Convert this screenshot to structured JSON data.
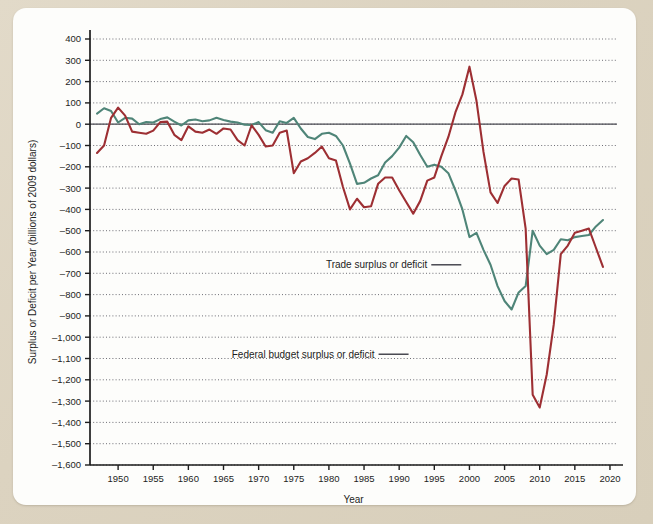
{
  "figure": {
    "background_color": "#ded5c2",
    "card_color": "#fdfdfb"
  },
  "chart_data": {
    "type": "line",
    "title": "",
    "xlabel": "Year",
    "ylabel": "Surplus or Deficit per Year (billions of 2009 dollars)",
    "xlim": [
      1946,
      2021
    ],
    "ylim": [
      -1600,
      400
    ],
    "grid": true,
    "legend_position": "inline-annotation",
    "x_ticks": [
      1950,
      1955,
      1960,
      1965,
      1970,
      1975,
      1980,
      1985,
      1990,
      1995,
      2000,
      2005,
      2010,
      2015,
      2020
    ],
    "x_tick_labels": [
      "1950",
      "1955",
      "1960",
      "1965",
      "1970",
      "1975",
      "1980",
      "1985",
      "1990",
      "1995",
      "2000",
      "2005",
      "2010",
      "2015",
      "2020"
    ],
    "y_ticks": [
      400,
      300,
      200,
      100,
      0,
      -100,
      -200,
      -300,
      -400,
      -500,
      -600,
      -700,
      -800,
      -900,
      -1000,
      -1100,
      -1200,
      -1300,
      -1400,
      -1500,
      -1600
    ],
    "y_tick_labels": [
      "400",
      "300",
      "200",
      "100",
      "0",
      "–100",
      "–200",
      "–300",
      "–400",
      "–500",
      "–600",
      "–700",
      "–800",
      "–900",
      "–1,000",
      "–1,100",
      "–1,200",
      "–1,300",
      "–1,400",
      "–1,500",
      "–1,600"
    ],
    "zero_line": 0,
    "series": [
      {
        "name": "Trade surplus or deficit",
        "color": "#4f8578",
        "annotation": "Trade surplus or deficit",
        "annotation_x": 1994.0,
        "annotation_y": -660,
        "x": [
          1947,
          1948,
          1949,
          1950,
          1951,
          1952,
          1953,
          1954,
          1955,
          1956,
          1957,
          1958,
          1959,
          1960,
          1961,
          1962,
          1963,
          1964,
          1965,
          1966,
          1967,
          1968,
          1969,
          1970,
          1971,
          1972,
          1973,
          1974,
          1975,
          1976,
          1977,
          1978,
          1979,
          1980,
          1981,
          1982,
          1983,
          1984,
          1985,
          1986,
          1987,
          1988,
          1989,
          1990,
          1991,
          1992,
          1993,
          1994,
          1995,
          1996,
          1997,
          1998,
          1999,
          2000,
          2001,
          2002,
          2003,
          2004,
          2005,
          2006,
          2007,
          2008,
          2009,
          2010,
          2011,
          2012,
          2013,
          2014,
          2015,
          2016,
          2017,
          2018,
          2019
        ],
        "values": [
          50,
          75,
          62,
          8,
          30,
          26,
          0,
          10,
          8,
          24,
          32,
          12,
          -6,
          18,
          22,
          14,
          18,
          30,
          20,
          12,
          8,
          -2,
          -4,
          10,
          -28,
          -40,
          14,
          6,
          30,
          -20,
          -60,
          -70,
          -45,
          -40,
          -55,
          -100,
          -185,
          -280,
          -275,
          -255,
          -240,
          -180,
          -150,
          -110,
          -55,
          -85,
          -145,
          -200,
          -190,
          -200,
          -230,
          -310,
          -400,
          -530,
          -510,
          -590,
          -660,
          -760,
          -830,
          -870,
          -790,
          -760,
          -500,
          -570,
          -610,
          -590,
          -540,
          -545,
          -530,
          -525,
          -520,
          -480,
          -450
        ]
      },
      {
        "name": "Federal budget surplus or deficit",
        "color": "#9d2f33",
        "annotation": "Federal budget surplus or deficit",
        "annotation_x": 1986.5,
        "annotation_y": -1080,
        "x": [
          1947,
          1948,
          1949,
          1950,
          1951,
          1952,
          1953,
          1954,
          1955,
          1956,
          1957,
          1958,
          1959,
          1960,
          1961,
          1962,
          1963,
          1964,
          1965,
          1966,
          1967,
          1968,
          1969,
          1970,
          1971,
          1972,
          1973,
          1974,
          1975,
          1976,
          1977,
          1978,
          1979,
          1980,
          1981,
          1982,
          1983,
          1984,
          1985,
          1986,
          1987,
          1988,
          1989,
          1990,
          1991,
          1992,
          1993,
          1994,
          1995,
          1996,
          1997,
          1998,
          1999,
          2000,
          2001,
          2002,
          2003,
          2004,
          2005,
          2006,
          2007,
          2008,
          2009,
          2010,
          2011,
          2012,
          2013,
          2014,
          2015,
          2016,
          2017,
          2018,
          2019
        ],
        "values": [
          -135,
          -100,
          30,
          78,
          40,
          -35,
          -40,
          -45,
          -30,
          10,
          12,
          -50,
          -75,
          -10,
          -35,
          -40,
          -25,
          -45,
          -20,
          -25,
          -75,
          -100,
          -5,
          -50,
          -105,
          -100,
          -40,
          -30,
          -230,
          -175,
          -160,
          -135,
          -105,
          -160,
          -170,
          -295,
          -400,
          -350,
          -390,
          -385,
          -280,
          -250,
          -250,
          -310,
          -365,
          -420,
          -360,
          -265,
          -250,
          -150,
          -60,
          55,
          140,
          270,
          110,
          -130,
          -320,
          -370,
          -290,
          -255,
          -260,
          -490,
          -1270,
          -1330,
          -1175,
          -940,
          -610,
          -570,
          -510,
          -500,
          -490,
          -580,
          -670
        ]
      }
    ]
  },
  "axes": {
    "y_axis_title": "Surplus or Deficit per Year (billions of 2009 dollars)",
    "x_axis_title": "Year"
  }
}
